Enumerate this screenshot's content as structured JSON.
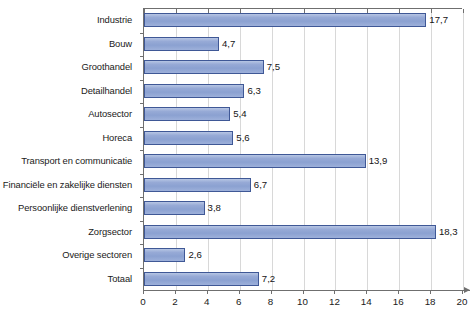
{
  "chart_data": {
    "type": "bar",
    "orientation": "horizontal",
    "title": "",
    "subtitle": "",
    "xlabel": "",
    "ylabel": "",
    "xlim": [
      0,
      20
    ],
    "ylim": null,
    "grid": true,
    "grid_axis": "x",
    "legend": false,
    "legend_position": "none",
    "xticks": [
      0,
      2,
      4,
      6,
      8,
      10,
      12,
      14,
      16,
      18,
      20
    ],
    "xtick_labels": [
      "0",
      "2",
      "4",
      "6",
      "8",
      "10",
      "12",
      "14",
      "16",
      "18",
      "20"
    ],
    "decimal_separator": ",",
    "categories": [
      "Industrie",
      "Bouw",
      "Groothandel",
      "Detailhandel",
      "Autosector",
      "Horeca",
      "Transport en communicatie",
      "Financiële en zakelijke diensten",
      "Persoonlijke dienstverlening",
      "Zorgsector",
      "Overige sectoren",
      "Totaal"
    ],
    "values": [
      17.7,
      4.7,
      7.5,
      6.3,
      5.4,
      5.6,
      13.9,
      6.7,
      3.8,
      18.3,
      2.6,
      7.2
    ],
    "value_labels": [
      "17,7",
      "4,7",
      "7,5",
      "6,3",
      "5,4",
      "5,6",
      "13,9",
      "6,7",
      "3,8",
      "18,3",
      "2,6",
      "7,2"
    ],
    "colors": {
      "bar_fill": "#8ba1d1",
      "bar_fill_light": "#b7c6e4",
      "bar_border": "#3f5896",
      "gridline": "#d8d8d8",
      "axis": "#6f6f6f",
      "text": "#1a1a1a",
      "background": "#ffffff"
    }
  }
}
